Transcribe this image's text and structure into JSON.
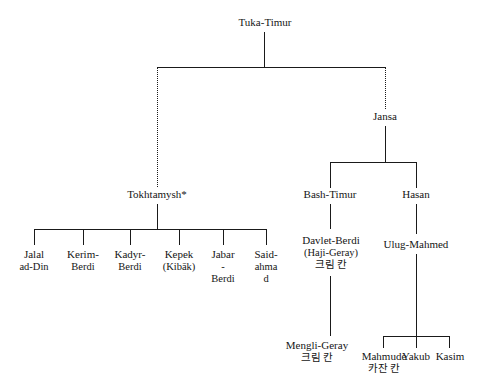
{
  "diagram": {
    "line_color": "#1a1a1a",
    "background": "#ffffff"
  },
  "nodes": {
    "root": {
      "label": "Tuka-Timur"
    },
    "jansa": {
      "label": "Jansa"
    },
    "tokhtamysh": {
      "label": "Tokhtamysh*"
    },
    "bash_timur": {
      "label": "Bash-Timur"
    },
    "hasan": {
      "label": "Hasan"
    },
    "davlet_berdi": {
      "line1": "Davlet-Berdi",
      "line2": "(Haji-Geray)",
      "line3": "크림 칸"
    },
    "ulug_mahmed": {
      "label": "Ulug-Mahmed"
    },
    "mengli_geray": {
      "line1": "Mengli-Geray",
      "line2": "크림 칸"
    }
  },
  "tokhtamysh_children": [
    {
      "line1": "Jalal",
      "line2": "ad-Din"
    },
    {
      "line1": "Kerim-",
      "line2": "Berdi"
    },
    {
      "line1": "Kadyr-",
      "line2": "Berdi"
    },
    {
      "line1": "Kepek",
      "line2": "(Kibāk)"
    },
    {
      "line1": "Jabar",
      "line2": "-",
      "line3": "Berdi"
    },
    {
      "line1": "Said-",
      "line2": "ahma",
      "line3": "d"
    }
  ],
  "ulug_mahmed_children": [
    {
      "line1": "Mahmude",
      "line2": "카잔 칸"
    },
    {
      "line1": "Yakub",
      "line2": ""
    },
    {
      "line1": "Kasim",
      "line2": ""
    }
  ]
}
